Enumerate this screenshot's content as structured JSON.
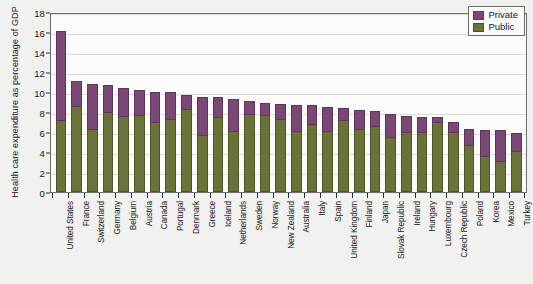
{
  "chart_data": {
    "type": "bar",
    "subtype": "stacked-vertical",
    "title": "",
    "xlabel": "",
    "ylabel": "Health care expenditure as percentage of GDP",
    "ylim": [
      0,
      18
    ],
    "ytick_labels": [
      "18",
      "16",
      "14",
      "12",
      "10",
      "8",
      "6",
      "4",
      "2",
      "0"
    ],
    "ytick_values": [
      18,
      16,
      14,
      12,
      10,
      8,
      6,
      4,
      2,
      0
    ],
    "grid": true,
    "legend_position": "top-right",
    "legend": [
      "Private",
      "Public"
    ],
    "colors": {
      "private": "#7b4876",
      "public": "#6b7238",
      "plot_background": "#fbfbf9",
      "page_background": "#f1f1ef",
      "axis": "#2b2b2b",
      "gridline": "#dcdcd8"
    },
    "categories": [
      "United States",
      "France",
      "Switzerland",
      "Germany",
      "Belgium",
      "Austria",
      "Canada",
      "Portugal",
      "Denmark",
      "Greece",
      "Iceland",
      "Netherlands",
      "Sweden",
      "Norway",
      "New Zealand",
      "Australia",
      "Italy",
      "Spain",
      "United Kingdom",
      "Finland",
      "Japan",
      "Slovak Republic",
      "Ireland",
      "Hungary",
      "Luxembourg",
      "Czech Republic",
      "Poland",
      "Korea",
      "Mexico",
      "Turkey"
    ],
    "series": [
      {
        "name": "Public",
        "color": "#6b7238",
        "values": [
          7.1,
          8.5,
          6.2,
          7.9,
          7.5,
          7.6,
          6.9,
          7.2,
          8.2,
          5.6,
          7.4,
          6.0,
          7.7,
          7.6,
          7.2,
          6.0,
          6.7,
          6.0,
          7.1,
          6.2,
          6.5,
          5.4,
          5.9,
          5.9,
          6.9,
          5.9,
          4.6,
          3.5,
          3.0,
          4.0
        ]
      },
      {
        "name": "Private",
        "color": "#7b4876",
        "values": [
          9.0,
          2.6,
          4.6,
          2.8,
          2.9,
          2.6,
          3.1,
          2.8,
          1.5,
          3.9,
          2.1,
          3.3,
          1.4,
          1.3,
          1.6,
          2.7,
          2.0,
          2.5,
          1.3,
          2.0,
          1.6,
          2.4,
          1.7,
          1.6,
          0.6,
          1.1,
          1.7,
          2.7,
          3.2,
          1.9
        ]
      }
    ],
    "totals": [
      16.1,
      11.1,
      10.8,
      10.7,
      10.4,
      10.2,
      10.0,
      10.0,
      9.7,
      9.5,
      9.5,
      9.3,
      9.1,
      8.9,
      8.8,
      8.7,
      8.7,
      8.5,
      8.4,
      8.2,
      8.1,
      7.8,
      7.6,
      7.5,
      7.5,
      7.0,
      6.3,
      6.2,
      6.2,
      5.9
    ],
    "note": "Stacked bars: olive segment = Public, purple segment above = Private"
  }
}
